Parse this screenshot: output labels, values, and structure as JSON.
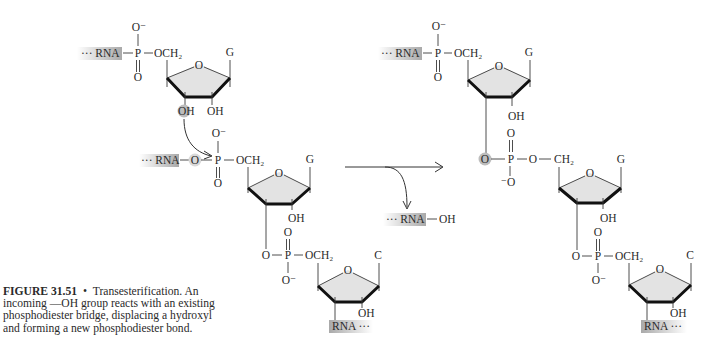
{
  "caption": {
    "label": "FIGURE 31.51",
    "bullet": "•",
    "lines": [
      "Transesterification. An",
      "incoming —OH group reacts with an existing",
      "phosphodiester bridge, displacing a hydroxyl",
      "and forming a new phosphodiester bond."
    ]
  },
  "colors": {
    "ring_fill": "#e3e3e3",
    "highlight": "#bdbdbd",
    "rna_label_shade": "#a9a9a9",
    "text": "#2a2a2a"
  },
  "reactant": {
    "nucleotide_1": {
      "rna": "··· RNA",
      "p": "P",
      "o_minus": "O⁻",
      "o_double": "O",
      "och2": "OCH₂",
      "ring_o": "O",
      "base": "G",
      "oh_3": "OH",
      "oh_2": "OH"
    },
    "nucleotide_2": {
      "rna": "··· RNA",
      "o_bridge": "O",
      "p": "P",
      "o_minus": "O⁻",
      "o_double": "O",
      "och2": "OCH₂",
      "ring_o": "O",
      "base": "G",
      "oh_2": "OH"
    },
    "phosphodiester": {
      "o_3": "O",
      "p": "P",
      "o_double": "O",
      "o_minus": "O⁻",
      "och2": "OCH₂"
    },
    "nucleotide_3": {
      "ring_o": "O",
      "base": "C",
      "oh_2": "OH",
      "rna": "RNA ···"
    }
  },
  "reaction": {
    "byproduct_rna": "··· RNA",
    "byproduct_oh": "OH"
  },
  "product": {
    "nucleotide_1": {
      "rna": "··· RNA",
      "p": "P",
      "o_minus": "O⁻",
      "o_double": "O",
      "och2": "OCH₂",
      "ring_o": "O",
      "base": "G",
      "oh_2": "OH"
    },
    "new_phosphodiester": {
      "o_3": "O",
      "p": "P",
      "o_double": "O",
      "o_minus": "⁻O",
      "o_5": "O",
      "ch2": "CH₂"
    },
    "nucleotide_2": {
      "ring_o": "O",
      "base": "G",
      "oh_2": "OH"
    },
    "phosphodiester": {
      "o_3": "O",
      "p": "P",
      "o_double": "O",
      "o_minus": "O⁻",
      "och2": "OCH₂"
    },
    "nucleotide_3": {
      "ring_o": "O",
      "base": "C",
      "oh_2": "OH",
      "rna": "RNA ···"
    }
  }
}
